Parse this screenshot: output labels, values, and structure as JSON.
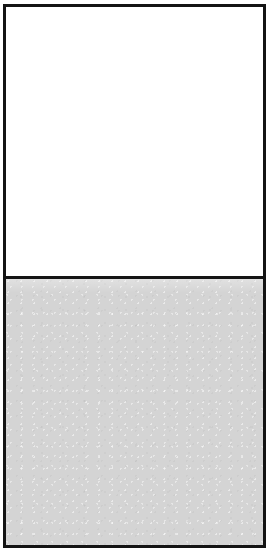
{
  "figure": {
    "type": "two-pane-rectangle",
    "border_color": "#141414",
    "border_width_px": 3,
    "background_color": "#ffffff",
    "box": {
      "left_px": 3,
      "top_px": 4,
      "width_px": 263,
      "height_px": 544
    },
    "divider": {
      "orientation": "horizontal",
      "y_px": 275,
      "thickness_px": 3,
      "color": "#141414"
    },
    "panes": [
      {
        "name": "upper-pane",
        "fill_color": "#ffffff",
        "fill_label": "white",
        "height_px": 269,
        "text": ""
      },
      {
        "name": "lower-pane",
        "fill_color": "#d4d4d4",
        "fill_label": "light gray",
        "height_px": 269,
        "text": ""
      }
    ]
  }
}
